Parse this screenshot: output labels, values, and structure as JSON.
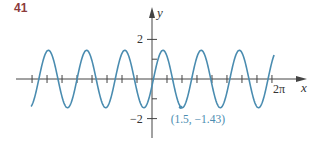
{
  "problem_number": "41",
  "chart_data": {
    "type": "line",
    "title": "",
    "xlabel": "x",
    "ylabel": "y",
    "x_tick_label": "2π",
    "x_tick_label_value": 6.283,
    "y_tick_labels": [
      {
        "value": 2,
        "label": "2"
      },
      {
        "value": -2,
        "label": "−2"
      }
    ],
    "y_ticks": [
      -2,
      -1,
      1,
      2
    ],
    "x_tick_spacing": 0.785,
    "xlim": [
      -6.8,
      8.1
    ],
    "ylim": [
      -3.0,
      3.6
    ],
    "series": [
      {
        "name": "curve",
        "function": "1.45*sin(pi*x - 0.24)",
        "amplitude": 1.45,
        "angular_frequency": 3.14159,
        "phase": -0.24,
        "domain": [
          -6.33,
          6.39
        ],
        "color": "#4a8cb0"
      }
    ],
    "annotations": [
      {
        "x": 1.5,
        "y": -1.43,
        "label": "(1.5, −1.43)"
      }
    ],
    "grid": false
  },
  "layout": {
    "origin_px": [
      152,
      79
    ],
    "x_scale_px": 19.1,
    "y_scale_px": 19.8,
    "axis_color": "#444444",
    "curve_color": "#4a8cb0",
    "label_color": "#8c3b3b"
  }
}
